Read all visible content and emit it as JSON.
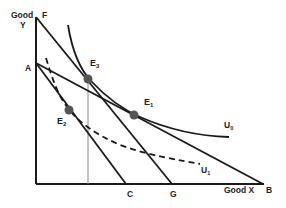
{
  "diagram": {
    "type": "indifference-curve-budget-line",
    "axes": {
      "y_label_line1": "Good",
      "y_label_line2": "Y",
      "x_label": "Good X"
    },
    "points": {
      "F": "F",
      "A": "A",
      "C": "C",
      "G": "G",
      "B": "B"
    },
    "equilibria": {
      "E1": {
        "main": "E",
        "sub": "1"
      },
      "E2": {
        "main": "E",
        "sub": "2"
      },
      "E3": {
        "main": "E",
        "sub": "3"
      }
    },
    "curves": {
      "U0": {
        "main": "U",
        "sub": "0",
        "style": "solid"
      },
      "U1": {
        "main": "U",
        "sub": "1",
        "style": "dashed"
      }
    },
    "lines": [
      {
        "name": "budget-FG",
        "from": "F",
        "to": "G"
      },
      {
        "name": "budget-AC",
        "from": "A",
        "to": "C"
      },
      {
        "name": "budget-AB",
        "from": "A",
        "to": "B"
      }
    ],
    "colors": {
      "line": "#1a1a1a",
      "point": "#555555",
      "guide": "#888888"
    }
  }
}
